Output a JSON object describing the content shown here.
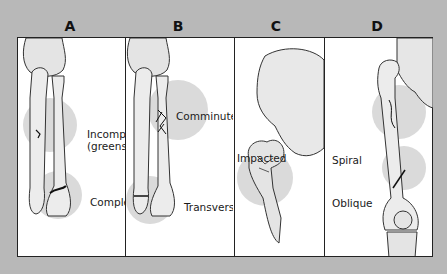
{
  "figure": {
    "panels": [
      {
        "letter": "A",
        "labels": [
          "Incomplete",
          "(greenstick)",
          "Complete"
        ]
      },
      {
        "letter": "B",
        "labels": [
          "Comminuted",
          "Transverse"
        ]
      },
      {
        "letter": "C",
        "labels": [
          "Impacted"
        ]
      },
      {
        "letter": "D",
        "labels": [
          "Spiral",
          "Oblique"
        ]
      }
    ]
  },
  "colors": {
    "background": "#b8b8b8",
    "panel": "#ffffff",
    "highlight": "#d9d9d9",
    "bone": "#e6e6e6",
    "outline": "#222222"
  }
}
